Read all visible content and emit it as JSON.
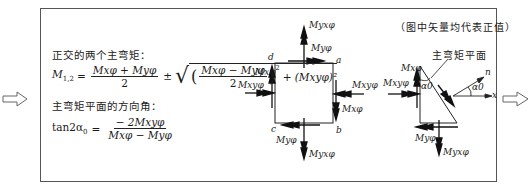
{
  "note": "（图中矢量均代表正值）",
  "heading_principal": "正交的两个主弯矩：",
  "formula_principal": {
    "lhs": "M",
    "lhs_sub": "1,2",
    "eq": "=",
    "frac1_num": "Mxφ + Myφ",
    "frac1_den": "2",
    "pm": "±",
    "sqrt_inner_num": "Mxφ − Myφ",
    "sqrt_inner_den": "2",
    "sqrt_tail": "+ (Mxyφ)²"
  },
  "heading_direction": "主弯矩平面的方向角：",
  "formula_direction": {
    "lhs": "tan2α",
    "lhs_sub": "0",
    "eq": "=",
    "num": "− 2Mxyφ",
    "den": "Mxφ − Myφ"
  },
  "square_labels": {
    "corner_a": "a",
    "corner_b": "b",
    "corner_c": "c",
    "corner_d": "d",
    "top_outer": "Myxφ",
    "top_inner": "Myφ",
    "left_upper": "Mxφ",
    "left_lower": "Mxyφ",
    "right_upper": "Mxyφ",
    "right_lower": "Mxφ",
    "bottom_inner": "Myφ",
    "bottom_outer": "Myxφ"
  },
  "triangle_labels": {
    "plane_label": "主弯矩平面",
    "left_upper": "Mxφ",
    "left_lower": "Mxyφ",
    "angle": "α0",
    "bottom_inner": "Myφ",
    "bottom_outer": "Myxφ"
  },
  "axes_labels": {
    "n": "n",
    "x": "x",
    "angle": "α0"
  },
  "arrows": {
    "left": "⇨",
    "right": "⇨"
  }
}
